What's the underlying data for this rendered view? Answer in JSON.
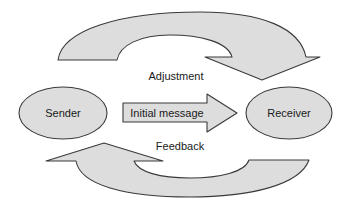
{
  "diagram": {
    "type": "communication-loop",
    "nodes": [
      {
        "id": "sender",
        "label": "Sender",
        "shape": "ellipse"
      },
      {
        "id": "receiver",
        "label": "Receiver",
        "shape": "ellipse"
      }
    ],
    "edges": [
      {
        "id": "initial",
        "from": "sender",
        "to": "receiver",
        "label": "Initial message",
        "style": "block-arrow"
      },
      {
        "id": "adjustment",
        "from": "sender",
        "to": "receiver",
        "label": "Adjustment",
        "style": "curved-arrow-top"
      },
      {
        "id": "feedback",
        "from": "receiver",
        "to": "sender",
        "label": "Feedback",
        "style": "curved-arrow-bottom"
      }
    ],
    "labels": {
      "sender": "Sender",
      "receiver": "Receiver",
      "initial_message": "Initial message",
      "adjustment": "Adjustment",
      "feedback": "Feedback"
    },
    "colors": {
      "fill": "#dddddd",
      "stroke": "#3a3a3a",
      "text": "#1a1a1a",
      "background": "#ffffff"
    }
  }
}
